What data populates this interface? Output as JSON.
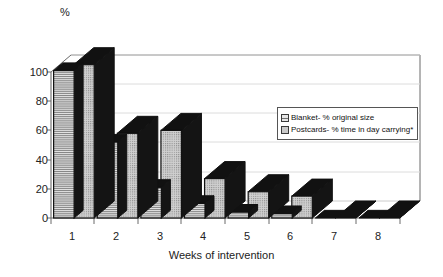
{
  "chart_data": {
    "type": "bar",
    "title": "",
    "xlabel": "Weeks of intervention",
    "ylabel": "%",
    "categories": [
      "1",
      "2",
      "3",
      "4",
      "5",
      "6",
      "7",
      "8"
    ],
    "ylim": [
      0,
      110
    ],
    "yticks": [
      0,
      20,
      40,
      60,
      80,
      100
    ],
    "grid": true,
    "legend_position": "center-right",
    "style": "3d-bar",
    "series": [
      {
        "name": "Blanket- % original size",
        "pattern": "horizontal-stripes",
        "values": [
          101,
          52,
          21,
          10,
          4,
          3,
          0,
          0
        ]
      },
      {
        "name": "Postcards- % time in day carrying*",
        "pattern": "fine-dots",
        "values": [
          105,
          58,
          60,
          27,
          18,
          15,
          0,
          0
        ]
      }
    ]
  },
  "axes": {
    "y_unit_label": "%",
    "y_tick_labels": [
      "100",
      "80",
      "60",
      "40",
      "20",
      "0"
    ],
    "x_tick_labels": [
      "1",
      "2",
      "3",
      "4",
      "5",
      "6",
      "7",
      "8"
    ],
    "x_axis_title": "Weeks of intervention"
  },
  "legend": {
    "items": [
      {
        "label": "Blanket- % original size",
        "swatch": "striped-swatch-icon"
      },
      {
        "label": "Postcards- % time in day carrying*",
        "swatch": "dotted-swatch-icon"
      }
    ]
  },
  "colors": {
    "bar_face_light": "#d5d5d5",
    "bar_face_mid": "#c9c9c9",
    "bar_top_dark": "#111111",
    "bar_side_dark": "#111111",
    "axis_line": "#555555",
    "gridline": "#d8d8d8",
    "background": "#ffffff",
    "text": "#1a1a1a"
  }
}
